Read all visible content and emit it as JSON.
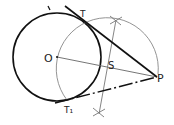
{
  "diagram": {
    "colors": {
      "background": "#ffffff",
      "stroke_bold": "#111111",
      "stroke_thin": "#777777",
      "label": "#222222"
    },
    "points": {
      "O": {
        "label": "O",
        "x": 57,
        "y": 57
      },
      "P": {
        "label": "P",
        "x": 157,
        "y": 77
      },
      "S": {
        "label": "S",
        "x": 107,
        "y": 67
      },
      "T": {
        "label": "T",
        "x": 82,
        "y": 20
      },
      "T1": {
        "label": "T1",
        "x": 67,
        "y": 100
      }
    },
    "main_circle": {
      "center": "O",
      "radius": 44
    },
    "construction_arc": {
      "center": "S",
      "radius": 51
    },
    "labels": {
      "O": "O",
      "P": "P",
      "S": "S",
      "T": "T",
      "T1": "T₁"
    }
  }
}
